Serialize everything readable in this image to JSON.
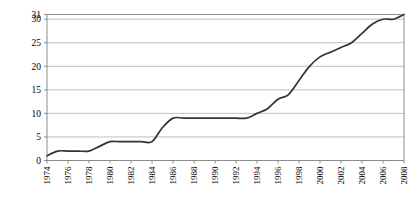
{
  "chart_data": {
    "type": "line",
    "title": "",
    "xlabel": "",
    "ylabel": "Number of jurisdictions",
    "xlim": [
      1974,
      2008
    ],
    "ylim": [
      0,
      31
    ],
    "grid": true,
    "legend": false,
    "line_color": "#333333",
    "gridline_color": "#b0b0b0",
    "axis_color": "#808080",
    "background_color": "#ffffff",
    "y_ticks": [
      0,
      5,
      10,
      15,
      20,
      25,
      30,
      31
    ],
    "y_tick_labels": [
      "0",
      "5",
      "10",
      "15",
      "20",
      "25",
      "30",
      "31"
    ],
    "x_ticks": [
      1974,
      1976,
      1978,
      1980,
      1982,
      1984,
      1986,
      1988,
      1990,
      1992,
      1994,
      1996,
      1998,
      2000,
      2002,
      2004,
      2006,
      2008
    ],
    "x_tick_labels": [
      "1974",
      "1976",
      "1978",
      "1980",
      "1982",
      "1984",
      "1986",
      "1988",
      "1990",
      "1992",
      "1994",
      "1996",
      "1998",
      "2000",
      "2002",
      "2004",
      "2006",
      "2008"
    ],
    "x": [
      1974,
      1975,
      1976,
      1977,
      1978,
      1979,
      1980,
      1981,
      1982,
      1983,
      1984,
      1985,
      1986,
      1987,
      1988,
      1989,
      1990,
      1991,
      1992,
      1993,
      1994,
      1995,
      1996,
      1997,
      1998,
      1999,
      2000,
      2001,
      2002,
      2003,
      2004,
      2005,
      2006,
      2007,
      2008
    ],
    "values": [
      1,
      2,
      2,
      2,
      2,
      3,
      4,
      4,
      4,
      4,
      4,
      7,
      9,
      9,
      9,
      9,
      9,
      9,
      9,
      9,
      10,
      11,
      13,
      14,
      17,
      20,
      22,
      23,
      24,
      25,
      27,
      29,
      30,
      30,
      31
    ],
    "series": [
      {
        "name": "Number of jurisdictions",
        "values": [
          1,
          2,
          2,
          2,
          2,
          3,
          4,
          4,
          4,
          4,
          4,
          7,
          9,
          9,
          9,
          9,
          9,
          9,
          9,
          9,
          10,
          11,
          13,
          14,
          17,
          20,
          22,
          23,
          24,
          25,
          27,
          29,
          30,
          30,
          31
        ]
      }
    ]
  }
}
